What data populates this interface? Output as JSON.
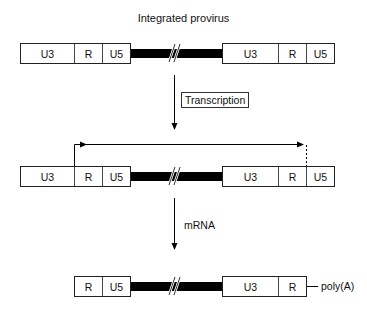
{
  "title": "Integrated provirus",
  "rows": {
    "provirus": {
      "left": [
        "U3",
        "R",
        "U5"
      ],
      "right": [
        "U3",
        "R",
        "U5"
      ]
    },
    "transcribed": {
      "left": [
        "U3",
        "R",
        "U5"
      ],
      "right": [
        "U3",
        "R",
        "U5"
      ]
    },
    "mrna": {
      "left": [
        "R",
        "U5"
      ],
      "right": [
        "U3",
        "R"
      ],
      "tail": "poly(A)"
    }
  },
  "steps": {
    "transcription": "Transcription",
    "mrna": "mRNA"
  }
}
